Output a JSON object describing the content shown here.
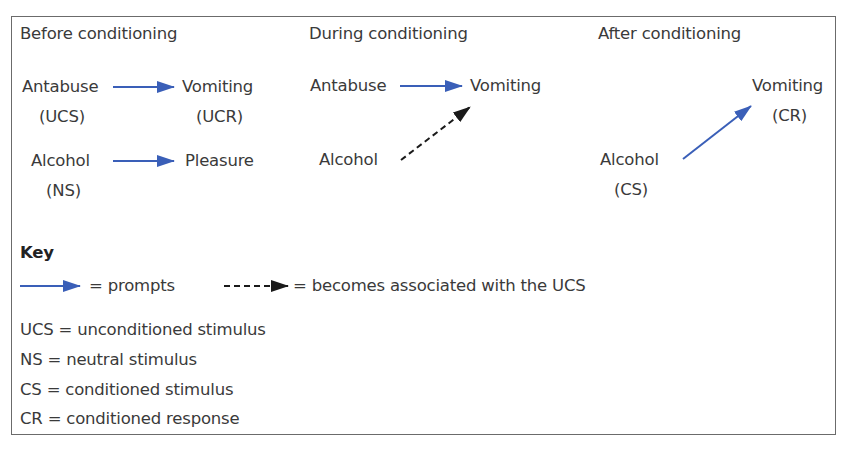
{
  "colors": {
    "prompt_arrow": "#3a5fb8",
    "assoc_arrow": "#1a1a1a",
    "text": "#3a3a3a",
    "border": "#6b6b6b"
  },
  "stages": [
    {
      "heading": "Before conditioning",
      "rows": [
        {
          "stimulus": "Antabuse",
          "stimulus_tag": "(UCS)",
          "arrow": "prompts",
          "response": "Vomiting",
          "response_tag": "(UCR)"
        },
        {
          "stimulus": "Alcohol",
          "stimulus_tag": "(NS)",
          "arrow": "prompts",
          "response": "Pleasure",
          "response_tag": ""
        }
      ]
    },
    {
      "heading": "During conditioning",
      "rows": [
        {
          "stimulus": "Antabuse",
          "arrow": "prompts",
          "response": "Vomiting"
        },
        {
          "stimulus": "Alcohol",
          "arrow": "becomes associated with the UCS",
          "response": "Vomiting"
        }
      ]
    },
    {
      "heading": "After conditioning",
      "rows": [
        {
          "stimulus": "Alcohol",
          "stimulus_tag": "(CS)",
          "arrow": "prompts",
          "response": "Vomiting",
          "response_tag": "(CR)"
        }
      ]
    }
  ],
  "key": {
    "title": "Key",
    "arrows": [
      {
        "type": "solid",
        "label": "= prompts"
      },
      {
        "type": "dashed",
        "label": "= becomes associated with the UCS"
      }
    ],
    "abbreviations": [
      "UCS = unconditioned stimulus",
      "NS = neutral stimulus",
      "CS = conditioned stimulus",
      "CR = conditioned response"
    ]
  }
}
